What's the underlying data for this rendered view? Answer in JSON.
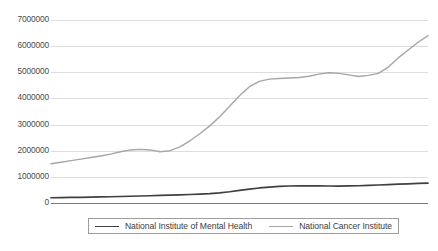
{
  "chart_data": {
    "type": "line",
    "title": "",
    "subtitle": "",
    "xlabel": "",
    "ylabel": "",
    "ylim": [
      0,
      7000000
    ],
    "xlim": [
      0,
      38
    ],
    "grid": true,
    "grid_axis": "y",
    "legend_position": "bottom",
    "y_ticks": [
      "7000000",
      "6000000",
      "5000000",
      "4000000",
      "3000000",
      "2000000",
      "1000000",
      "0"
    ],
    "y_tick_values": [
      7000000,
      6000000,
      5000000,
      4000000,
      3000000,
      2000000,
      1000000,
      0
    ],
    "x_tick_labels": [],
    "series": [
      {
        "name": "National Institute of Mental Health",
        "color": "#404040",
        "values": [
          200000,
          205000,
          212000,
          218000,
          225000,
          232000,
          240000,
          248000,
          258000,
          268000,
          278000,
          288000,
          300000,
          312000,
          325000,
          340000,
          360000,
          390000,
          430000,
          480000,
          530000,
          575000,
          610000,
          635000,
          650000,
          655000,
          658000,
          655000,
          650000,
          648000,
          652000,
          660000,
          672000,
          688000,
          705000,
          720000,
          735000,
          748000,
          760000
        ]
      },
      {
        "name": "National Cancer Institute",
        "color": "#a6a6a6",
        "values": [
          1500000,
          1560000,
          1620000,
          1680000,
          1740000,
          1800000,
          1870000,
          1960000,
          2030000,
          2050000,
          2030000,
          1960000,
          2000000,
          2150000,
          2380000,
          2650000,
          2950000,
          3300000,
          3700000,
          4100000,
          4450000,
          4650000,
          4740000,
          4760000,
          4780000,
          4800000,
          4850000,
          4930000,
          4980000,
          4960000,
          4900000,
          4840000,
          4880000,
          4960000,
          5200000,
          5550000,
          5850000,
          6150000,
          6400000
        ]
      }
    ]
  },
  "legend": {
    "items": [
      {
        "label": "National Institute of Mental Health",
        "swatch": "dark"
      },
      {
        "label": "National Cancer Institute",
        "swatch": "light"
      }
    ]
  },
  "colors": {
    "gridline": "#d9d9d9",
    "axis_line": "#7f7f7f",
    "nimh_line": "#404040",
    "nci_line": "#a6a6a6",
    "legend_border": "#9d9d9d",
    "tick_text": "#4a4a4a",
    "background": "#ffffff"
  }
}
